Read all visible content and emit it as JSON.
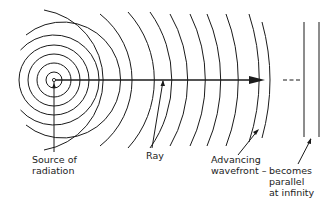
{
  "labels": {
    "source_line1": "Source of",
    "source_line2": "radiation",
    "ray": "Ray",
    "wavefront_line1": "Advancing",
    "wavefront_line2": "wavefront –",
    "parallel_line1": "becomes",
    "parallel_line2": "parallel",
    "parallel_line3": "at infinity"
  },
  "colors": {
    "line": "#1a1a1a",
    "background": "#ffffff"
  },
  "geometry": {
    "source": {
      "x": 54,
      "y": 80
    },
    "full_circle_radii": [
      8,
      17,
      26,
      35
    ],
    "arc_radii": [
      45,
      58,
      71,
      84,
      101,
      117,
      132,
      150,
      166,
      184,
      206,
      218
    ],
    "ray_end_x": 263,
    "dashed_segment": [
      283,
      302
    ],
    "parallel_lines_x": [
      304,
      319
    ],
    "parallel_lines_y": [
      22,
      137
    ]
  }
}
